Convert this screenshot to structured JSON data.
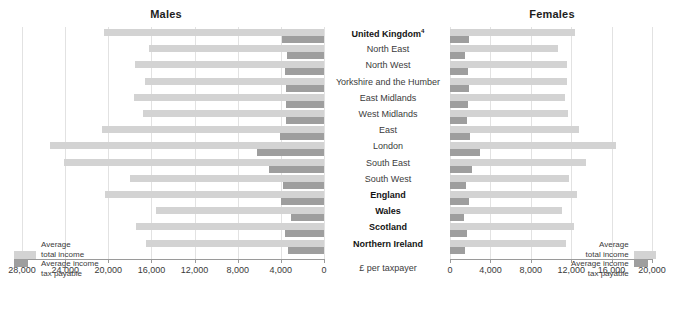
{
  "chart_data": {
    "type": "bar",
    "panels": [
      {
        "name": "males",
        "title": "Males",
        "direction": "right-to-left",
        "xlabel": "£ per taxpayer",
        "xlim": [
          0,
          28000
        ],
        "ticks": [
          28000,
          24000,
          20000,
          16000,
          12000,
          8000,
          4000,
          0
        ],
        "tick_labels": [
          "28,000",
          "24,000",
          "20,000",
          "16,000",
          "12,000",
          "8,000",
          "4,000",
          "0"
        ],
        "series": [
          {
            "name": "Average total income",
            "color": "#d3d3d3",
            "values": [
              20400,
              16200,
              17500,
              16600,
              17600,
              16800,
              20600,
              25400,
              24100,
              18000,
              20300,
              15600,
              17400,
              16500
            ]
          },
          {
            "name": "Average income tax payable",
            "color": "#9e9e9e",
            "values": [
              3900,
              3400,
              3600,
              3500,
              3500,
              3500,
              4100,
              6200,
              5100,
              3800,
              4000,
              3100,
              3600,
              3300
            ]
          }
        ]
      },
      {
        "name": "females",
        "title": "Females",
        "direction": "left-to-right",
        "xlabel": "£ per taxpayer",
        "xlim": [
          0,
          20000
        ],
        "ticks": [
          0,
          4000,
          8000,
          12000,
          16000,
          20000
        ],
        "tick_labels": [
          "0",
          "4,000",
          "8,000",
          "12,000",
          "16,000",
          "20,000"
        ],
        "series": [
          {
            "name": "Average total income",
            "color": "#d3d3d3",
            "values": [
              12400,
              10700,
              11600,
              11600,
              11400,
              11700,
              12800,
              16400,
              13500,
              11800,
              12600,
              11100,
              12300,
              11500
            ]
          },
          {
            "name": "Average income tax payable",
            "color": "#9e9e9e",
            "values": [
              1900,
              1500,
              1800,
              1900,
              1800,
              1700,
              2000,
              3000,
              2200,
              1600,
              1900,
              1400,
              1700,
              1500
            ]
          }
        ]
      }
    ],
    "categories": [
      {
        "label": "United Kingdom",
        "superscript": "4",
        "bold": true
      },
      {
        "label": "North East",
        "superscript": "",
        "bold": false
      },
      {
        "label": "North West",
        "superscript": "",
        "bold": false
      },
      {
        "label": "Yorkshire and the Humber",
        "superscript": "",
        "bold": false
      },
      {
        "label": "East Midlands",
        "superscript": "",
        "bold": false
      },
      {
        "label": "West Midlands",
        "superscript": "",
        "bold": false
      },
      {
        "label": "East",
        "superscript": "",
        "bold": false
      },
      {
        "label": "London",
        "superscript": "",
        "bold": false
      },
      {
        "label": "South East",
        "superscript": "",
        "bold": false
      },
      {
        "label": "South West",
        "superscript": "",
        "bold": false
      },
      {
        "label": "England",
        "superscript": "",
        "bold": true
      },
      {
        "label": "Wales",
        "superscript": "",
        "bold": true
      },
      {
        "label": "Scotland",
        "superscript": "",
        "bold": true
      },
      {
        "label": "Northern Ireland",
        "superscript": "",
        "bold": true
      }
    ],
    "legend": {
      "position": "inside-bottom",
      "entries": [
        {
          "label_line1": "Average",
          "label_line2": "total income",
          "color": "#d3d3d3"
        },
        {
          "label_line1": "Average income",
          "label_line2": "tax payable",
          "color": "#9e9e9e"
        }
      ]
    },
    "grid": true,
    "axis_unit_label": "£ per taxpayer"
  },
  "colors": {
    "total_income": "#d3d3d3",
    "tax_payable": "#9e9e9e",
    "grid": "#e2e2e2",
    "axis": "#9a9a9a",
    "text": "#3b3b3b",
    "background": "#ffffff"
  }
}
